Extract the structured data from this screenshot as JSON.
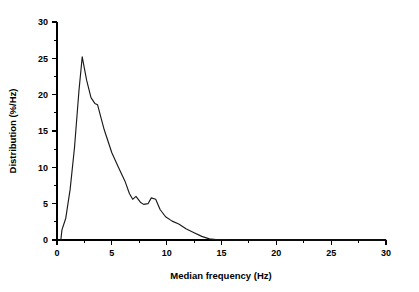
{
  "chart_data": {
    "type": "line",
    "title": "",
    "subtitle": "",
    "xlabel": "Median frequency (Hz)",
    "ylabel": "Distribution (%/Hz)",
    "xlim": [
      0,
      30
    ],
    "ylim": [
      0,
      30
    ],
    "xticks": [
      0,
      5,
      10,
      15,
      20,
      25,
      30
    ],
    "xtick_labels": [
      "0",
      "5",
      "10",
      "15",
      "20",
      "25",
      "30"
    ],
    "xminor_ticks": [
      2.5,
      7.5,
      12.5,
      17.5,
      22.5,
      27.5
    ],
    "yticks": [
      0,
      5,
      10,
      15,
      20,
      25,
      30
    ],
    "ytick_labels": [
      "0",
      "5",
      "10",
      "15",
      "20",
      "25",
      "30"
    ],
    "yminor_ticks": [
      2.5,
      7.5,
      12.5,
      17.5,
      22.5,
      27.5
    ],
    "grid": false,
    "legend": false,
    "legend_position": "none",
    "line_color": "#1a1a1a",
    "background_color": "#ffffff",
    "axis_color": "#000000",
    "series": [
      {
        "name": "Median frequency distribution",
        "x": [
          0.35,
          0.45,
          0.8,
          1.2,
          1.6,
          2.0,
          2.3,
          2.7,
          3.1,
          3.45,
          3.7,
          4.3,
          5.0,
          5.6,
          6.2,
          6.6,
          6.9,
          7.2,
          7.6,
          7.9,
          8.3,
          8.6,
          9.0,
          9.4,
          9.9,
          10.5,
          11.1,
          11.8,
          12.5,
          13.2,
          13.9,
          14.5,
          16.0,
          18.0,
          20.0,
          24.0,
          28.0,
          30.0
        ],
        "y": [
          0.0,
          1.4,
          3.0,
          7.0,
          12.8,
          20.5,
          25.2,
          22.0,
          19.6,
          18.8,
          18.6,
          15.2,
          12.0,
          10.0,
          8.1,
          6.4,
          5.6,
          6.0,
          5.2,
          4.9,
          5.0,
          5.8,
          5.6,
          4.2,
          3.2,
          2.6,
          2.2,
          1.5,
          1.0,
          0.5,
          0.15,
          0.05,
          0.0,
          0.0,
          0.0,
          0.0,
          0.0,
          0.0
        ]
      }
    ],
    "annotations": [],
    "peak": {
      "x": 2.3,
      "y": 25.2
    }
  }
}
